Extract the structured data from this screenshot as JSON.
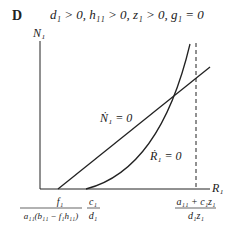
{
  "panel": {
    "letter": "D",
    "conditions": "d₁ > 0, h₁₁ > 0, z₁ > 0, g₁ = 0"
  },
  "axes": {
    "y_label": "N₁",
    "x_label": "R₁"
  },
  "curves": {
    "n_nullcline_label": "Ṅ₁ = 0",
    "r_nullcline_label": "Ṙ₁ = 0"
  },
  "x_ticks": {
    "tick1_num": "f₁",
    "tick1_den": "a₁₁(b₁₁ − f₁h₁₁)",
    "tick2_num": "c₁",
    "tick2_den": "d₁",
    "tick3_num": "a₁₁ + c₁z₁",
    "tick3_den": "d₁z₁"
  },
  "colors": {
    "ink": "#222222"
  }
}
